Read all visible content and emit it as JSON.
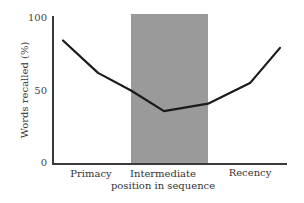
{
  "chart_data": {
    "type": "line",
    "title": "",
    "xlabel": "",
    "ylabel": "Words recalled (%)",
    "ylim": [
      0,
      100
    ],
    "yticks": [
      0,
      50,
      100
    ],
    "grid": false,
    "legend": null,
    "x_regions": [
      {
        "label": "Primacy",
        "shaded": false
      },
      {
        "label": "Intermediate position in sequence",
        "label_lines": [
          "Intermediate",
          "position in sequence"
        ],
        "shaded": true,
        "shade_color": "#9a9a9a"
      },
      {
        "label": "Recency",
        "shaded": false
      }
    ],
    "series": [
      {
        "name": "Serial position curve",
        "color": "#1a1a1a",
        "x": [
          1,
          2,
          3,
          4,
          5,
          6,
          7
        ],
        "values": [
          84,
          62,
          50,
          36,
          41,
          55,
          79
        ]
      }
    ]
  },
  "axis": {
    "ylabel": "Words recalled (%)",
    "ytick_100": "100",
    "ytick_50": "50",
    "ytick_0": "0"
  },
  "categories": {
    "primacy": "Primacy",
    "intermediate_line1": "Intermediate",
    "intermediate_line2": "position in sequence",
    "recency": "Recency"
  },
  "colors": {
    "line": "#1a1a1a",
    "shade": "#9a9a9a",
    "axis": "#3a3a3a"
  }
}
